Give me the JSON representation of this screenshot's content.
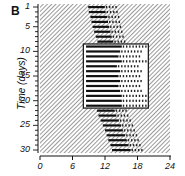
{
  "figure": {
    "panel_label": "B",
    "ylabel": "Time (days)",
    "xtick_labels": [
      "0",
      "6",
      "12",
      "18",
      "24"
    ],
    "ytick_labels": [
      "1",
      "5",
      "10",
      "15",
      "20",
      "25",
      "30"
    ]
  },
  "chart_data": {
    "type": "heatmap",
    "subtype": "actogram",
    "title": "",
    "panel": "B",
    "xlabel": "",
    "ylabel": "Time (days)",
    "xlim": [
      0,
      24
    ],
    "ylim": [
      1,
      30
    ],
    "y_inverted": true,
    "xticks": [
      0,
      6,
      12,
      18,
      24
    ],
    "yticks": [
      1,
      5,
      10,
      15,
      20,
      25,
      30
    ],
    "shaded_background": "hatched (dark phase)",
    "light_box": {
      "x_start_hour": 8,
      "x_end_hour": 20,
      "day_start": 9,
      "day_end": 21
    },
    "activity_estimated": true,
    "activity_note": "Illustrative trend only: onsets/offsets below are interpolated from the visual drift pattern, not measured per day from the figure.",
    "activity_bands": [
      {
        "day": 1,
        "onset": 8.9,
        "offset": 14.0
      },
      {
        "day": 2,
        "onset": 9.0,
        "offset": 14.2
      },
      {
        "day": 3,
        "onset": 9.3,
        "offset": 14.5
      },
      {
        "day": 4,
        "onset": 9.5,
        "offset": 14.6
      },
      {
        "day": 5,
        "onset": 9.7,
        "offset": 14.8
      },
      {
        "day": 6,
        "onset": 10.0,
        "offset": 15.0
      },
      {
        "day": 7,
        "onset": 10.3,
        "offset": 15.2
      },
      {
        "day": 8,
        "onset": 10.6,
        "offset": 15.5
      },
      {
        "day": 9,
        "onset": 8.5,
        "offset": 19.5
      },
      {
        "day": 10,
        "onset": 8.5,
        "offset": 19.0
      },
      {
        "day": 11,
        "onset": 8.5,
        "offset": 18.5
      },
      {
        "day": 12,
        "onset": 8.5,
        "offset": 19.5
      },
      {
        "day": 13,
        "onset": 8.5,
        "offset": 18.0
      },
      {
        "day": 14,
        "onset": 8.5,
        "offset": 19.0
      },
      {
        "day": 15,
        "onset": 8.5,
        "offset": 18.5
      },
      {
        "day": 16,
        "onset": 8.5,
        "offset": 19.0
      },
      {
        "day": 17,
        "onset": 8.5,
        "offset": 18.5
      },
      {
        "day": 18,
        "onset": 8.5,
        "offset": 19.0
      },
      {
        "day": 19,
        "onset": 8.5,
        "offset": 19.5
      },
      {
        "day": 20,
        "onset": 8.5,
        "offset": 19.5
      },
      {
        "day": 21,
        "onset": 8.5,
        "offset": 19.5
      },
      {
        "day": 22,
        "onset": 10.5,
        "offset": 16.0
      },
      {
        "day": 23,
        "onset": 10.8,
        "offset": 16.3
      },
      {
        "day": 24,
        "onset": 11.2,
        "offset": 16.8
      },
      {
        "day": 25,
        "onset": 11.6,
        "offset": 17.2
      },
      {
        "day": 26,
        "onset": 12.0,
        "offset": 17.5
      },
      {
        "day": 27,
        "onset": 12.3,
        "offset": 18.0
      },
      {
        "day": 28,
        "onset": 12.6,
        "offset": 18.3
      },
      {
        "day": 29,
        "onset": 13.0,
        "offset": 18.6
      },
      {
        "day": 30,
        "onset": 13.3,
        "offset": 19.0
      }
    ],
    "grid": false,
    "legend": null
  }
}
